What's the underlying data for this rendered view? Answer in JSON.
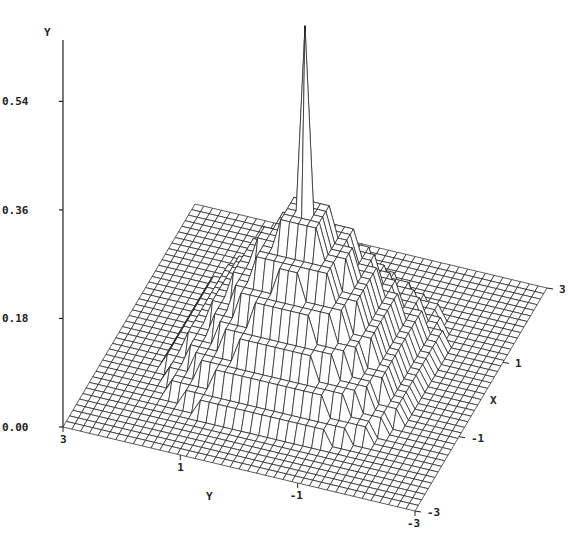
{
  "chart_data": {
    "type": "surface3d",
    "title": "",
    "vertical_axis": {
      "label": "Y",
      "ticks": [
        "0.00",
        "0.18",
        "0.36",
        "0.54"
      ],
      "tick_values": [
        0.0,
        0.18,
        0.36,
        0.54
      ],
      "range": [
        0.0,
        0.55
      ]
    },
    "x_axis": {
      "label": "X",
      "ticks": [
        "-3",
        "-1",
        "1",
        "3"
      ],
      "tick_values": [
        -3,
        -1,
        1,
        3
      ],
      "range": [
        -3,
        3
      ]
    },
    "y_axis": {
      "label": "Y",
      "ticks": [
        "3",
        "1",
        "-1",
        "-3"
      ],
      "tick_values": [
        3,
        1,
        -1,
        -3
      ],
      "range": [
        -3,
        3
      ]
    },
    "grid_resolution": 41,
    "surface_description": "Terraced radially symmetric peak centered at origin with a narrow central spike reaching about 0.55, stepped plateaus decreasing outward to zero near radius 2.4, and a faint ridge ring on the back side",
    "peak_value": 0.55,
    "terraces": [
      {
        "radius": 0.15,
        "value": 0.55
      },
      {
        "radius": 0.45,
        "value": 0.24
      },
      {
        "radius": 0.8,
        "value": 0.19
      },
      {
        "radius": 1.15,
        "value": 0.145
      },
      {
        "radius": 1.5,
        "value": 0.1
      },
      {
        "radius": 1.85,
        "value": 0.06
      },
      {
        "radius": 2.2,
        "value": 0.025
      },
      {
        "radius": 2.5,
        "value": 0.0
      }
    ]
  }
}
